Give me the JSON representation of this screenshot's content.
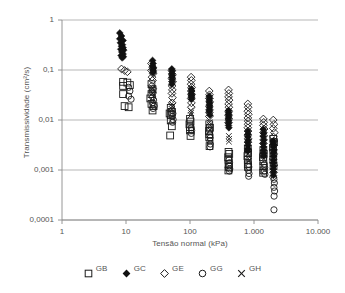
{
  "chart_data": {
    "type": "scatter",
    "title": "",
    "xlabel": "Tensão normal (kPa)",
    "ylabel": "Transmissividade (cm²/s)",
    "xscale": "log",
    "yscale": "log",
    "xlim": [
      1,
      10000
    ],
    "ylim": [
      0.0001,
      1
    ],
    "grid": "horizontal",
    "legend_position": "bottom",
    "xticks": [
      1,
      10,
      100,
      1000,
      10000
    ],
    "xticklabels": [
      "1",
      "10",
      "100",
      "1.000",
      "10.000"
    ],
    "yticks": [
      0.0001,
      0.001,
      0.01,
      0.1,
      1
    ],
    "yticklabels": [
      "0,0001",
      "0,001",
      "0,01",
      "0,1",
      "1"
    ],
    "series": [
      {
        "name": "GB",
        "marker": "open-square",
        "points": [
          [
            9,
            0.058
          ],
          [
            10.5,
            0.056
          ],
          [
            9,
            0.048
          ],
          [
            11.5,
            0.05
          ],
          [
            9,
            0.033
          ],
          [
            9.5,
            0.019
          ],
          [
            11,
            0.018
          ],
          [
            25,
            0.052
          ],
          [
            26,
            0.041
          ],
          [
            25,
            0.033
          ],
          [
            24,
            0.027
          ],
          [
            25,
            0.021
          ],
          [
            27,
            0.019
          ],
          [
            26,
            0.0155
          ],
          [
            50,
            0.0175
          ],
          [
            52,
            0.0145
          ],
          [
            48,
            0.0135
          ],
          [
            50,
            0.0125
          ],
          [
            50,
            0.0098
          ],
          [
            52,
            0.0075
          ],
          [
            49,
            0.0049
          ],
          [
            100,
            0.0105
          ],
          [
            102,
            0.0093
          ],
          [
            98,
            0.0082
          ],
          [
            100,
            0.0072
          ],
          [
            100,
            0.0062
          ],
          [
            102,
            0.0048
          ],
          [
            200,
            0.0082
          ],
          [
            205,
            0.007
          ],
          [
            198,
            0.006
          ],
          [
            200,
            0.0052
          ],
          [
            200,
            0.0045
          ],
          [
            202,
            0.003
          ],
          [
            400,
            0.0023
          ],
          [
            410,
            0.0021
          ],
          [
            395,
            0.0018
          ],
          [
            400,
            0.0016
          ],
          [
            400,
            0.0013
          ],
          [
            405,
            0.00115
          ],
          [
            398,
            0.00098
          ],
          [
            800,
            0.0027
          ],
          [
            810,
            0.0022
          ],
          [
            790,
            0.0019
          ],
          [
            800,
            0.0016
          ],
          [
            800,
            0.0013
          ],
          [
            805,
            0.00115
          ],
          [
            1400,
            0.0025
          ],
          [
            1420,
            0.0021
          ],
          [
            1380,
            0.0018
          ],
          [
            1400,
            0.0015
          ],
          [
            1400,
            0.0012
          ],
          [
            1410,
            0.00098
          ],
          [
            1390,
            0.00088
          ],
          [
            2000,
            0.0042
          ],
          [
            2050,
            0.0036
          ],
          [
            1980,
            0.0028
          ],
          [
            2000,
            0.0022
          ],
          [
            2000,
            0.0016
          ],
          [
            2020,
            0.0012
          ]
        ]
      },
      {
        "name": "GC",
        "marker": "filled-diamond",
        "points": [
          [
            8,
            0.55
          ],
          [
            8.5,
            0.48
          ],
          [
            8,
            0.42
          ],
          [
            9,
            0.39
          ],
          [
            8.2,
            0.35
          ],
          [
            8.8,
            0.32
          ],
          [
            8.5,
            0.3
          ],
          [
            9,
            0.28
          ],
          [
            8.3,
            0.26
          ],
          [
            9.2,
            0.25
          ],
          [
            8.6,
            0.23
          ],
          [
            9,
            0.21
          ],
          [
            8.4,
            0.195
          ],
          [
            9.1,
            0.185
          ],
          [
            8.7,
            0.175
          ],
          [
            26,
            0.155
          ],
          [
            26.5,
            0.135
          ],
          [
            26,
            0.12
          ],
          [
            27,
            0.11
          ],
          [
            26.2,
            0.1
          ],
          [
            26.8,
            0.095
          ],
          [
            26.5,
            0.088
          ],
          [
            52,
            0.105
          ],
          [
            52.5,
            0.095
          ],
          [
            52,
            0.085
          ],
          [
            53,
            0.078
          ],
          [
            52.3,
            0.072
          ],
          [
            52.8,
            0.065
          ],
          [
            52.5,
            0.058
          ],
          [
            52,
            0.052
          ],
          [
            105,
            0.042
          ],
          [
            105.5,
            0.038
          ],
          [
            105,
            0.034
          ],
          [
            106,
            0.032
          ],
          [
            105.3,
            0.03
          ],
          [
            105.8,
            0.028
          ],
          [
            105.5,
            0.026
          ],
          [
            200,
            0.03
          ],
          [
            202,
            0.027
          ],
          [
            200,
            0.024
          ],
          [
            203,
            0.022
          ],
          [
            200.5,
            0.02
          ],
          [
            202,
            0.018
          ],
          [
            201,
            0.016
          ],
          [
            200,
            0.0145
          ],
          [
            205,
            0.0125
          ],
          [
            400,
            0.0155
          ],
          [
            402,
            0.0142
          ],
          [
            400,
            0.013
          ],
          [
            403,
            0.012
          ],
          [
            400.5,
            0.011
          ],
          [
            402,
            0.0098
          ],
          [
            401,
            0.0088
          ],
          [
            400,
            0.0078
          ],
          [
            405,
            0.007
          ],
          [
            800,
            0.006
          ],
          [
            805,
            0.0052
          ],
          [
            800,
            0.0046
          ],
          [
            810,
            0.004
          ],
          [
            800.5,
            0.0036
          ],
          [
            805,
            0.0031
          ],
          [
            802,
            0.0027
          ],
          [
            800,
            0.0024
          ],
          [
            1400,
            0.0065
          ],
          [
            1410,
            0.0055
          ],
          [
            1400,
            0.0047
          ],
          [
            1420,
            0.004
          ],
          [
            1400.5,
            0.0034
          ],
          [
            1410,
            0.0029
          ],
          [
            1405,
            0.0025
          ],
          [
            1400,
            0.0022
          ],
          [
            1415,
            0.0019
          ],
          [
            2000,
            0.0038
          ],
          [
            2020,
            0.0033
          ],
          [
            2000,
            0.0029
          ],
          [
            2040,
            0.0025
          ],
          [
            2005,
            0.0022
          ],
          [
            2020,
            0.0019
          ],
          [
            2010,
            0.0016
          ],
          [
            2000,
            0.0014
          ],
          [
            2030,
            0.0012
          ],
          [
            2000,
            0.00105
          ],
          [
            2020,
            0.0009
          ],
          [
            2010,
            0.00078
          ]
        ]
      },
      {
        "name": "GE",
        "marker": "open-diamond",
        "points": [
          [
            8.5,
            0.105
          ],
          [
            9.5,
            0.098
          ],
          [
            10.5,
            0.092
          ],
          [
            25,
            0.135
          ],
          [
            26,
            0.115
          ],
          [
            25,
            0.098
          ],
          [
            26.5,
            0.085
          ],
          [
            25.5,
            0.072
          ],
          [
            26,
            0.062
          ],
          [
            25.2,
            0.048
          ],
          [
            26.2,
            0.042
          ],
          [
            25.8,
            0.036
          ],
          [
            52,
            0.098
          ],
          [
            53,
            0.082
          ],
          [
            52,
            0.068
          ],
          [
            53.5,
            0.058
          ],
          [
            52.5,
            0.048
          ],
          [
            53,
            0.04
          ],
          [
            52.2,
            0.034
          ],
          [
            53.2,
            0.028
          ],
          [
            52.8,
            0.022
          ],
          [
            104,
            0.072
          ],
          [
            105,
            0.062
          ],
          [
            104,
            0.052
          ],
          [
            106,
            0.045
          ],
          [
            104.5,
            0.038
          ],
          [
            105.5,
            0.032
          ],
          [
            104.2,
            0.027
          ],
          [
            105.2,
            0.022
          ],
          [
            104.8,
            0.018
          ],
          [
            200,
            0.038
          ],
          [
            202,
            0.032
          ],
          [
            200,
            0.027
          ],
          [
            203,
            0.023
          ],
          [
            200.5,
            0.019
          ],
          [
            202,
            0.016
          ],
          [
            201,
            0.014
          ],
          [
            200,
            0.0118
          ],
          [
            400,
            0.04
          ],
          [
            405,
            0.034
          ],
          [
            400,
            0.029
          ],
          [
            408,
            0.025
          ],
          [
            401,
            0.021
          ],
          [
            405,
            0.018
          ],
          [
            402,
            0.015
          ],
          [
            400,
            0.0125
          ],
          [
            404,
            0.0105
          ],
          [
            400,
            0.0088
          ],
          [
            800,
            0.021
          ],
          [
            810,
            0.018
          ],
          [
            800,
            0.015
          ],
          [
            815,
            0.013
          ],
          [
            802,
            0.011
          ],
          [
            810,
            0.0095
          ],
          [
            805,
            0.0082
          ],
          [
            800,
            0.007
          ],
          [
            808,
            0.006
          ],
          [
            800,
            0.005
          ],
          [
            810,
            0.0042
          ],
          [
            805,
            0.0036
          ],
          [
            1400,
            0.0105
          ],
          [
            1420,
            0.009
          ],
          [
            1400,
            0.0078
          ],
          [
            1440,
            0.0066
          ],
          [
            1405,
            0.0056
          ],
          [
            1420,
            0.0048
          ],
          [
            1410,
            0.004
          ],
          [
            1400,
            0.0034
          ],
          [
            2000,
            0.01
          ],
          [
            2050,
            0.0082
          ],
          [
            2000,
            0.0068
          ],
          [
            2080,
            0.0056
          ],
          [
            2010,
            0.0046
          ],
          [
            2050,
            0.0038
          ],
          [
            2020,
            0.0031
          ],
          [
            2000,
            0.0026
          ],
          [
            2040,
            0.0021
          ],
          [
            2000,
            0.00165
          ],
          [
            2050,
            0.00125
          ],
          [
            2020,
            0.0009
          ],
          [
            2000,
            0.00072
          ]
        ]
      },
      {
        "name": "GG",
        "marker": "open-circle",
        "points": [
          [
            11,
            0.045
          ],
          [
            11.5,
            0.038
          ],
          [
            11,
            0.03
          ],
          [
            12,
            0.026
          ],
          [
            26,
            0.029
          ],
          [
            27,
            0.025
          ],
          [
            26,
            0.022
          ],
          [
            27.5,
            0.019
          ],
          [
            26.5,
            0.017
          ],
          [
            53,
            0.0155
          ],
          [
            54,
            0.0135
          ],
          [
            53,
            0.0118
          ],
          [
            54.5,
            0.0102
          ],
          [
            53.5,
            0.009
          ],
          [
            105,
            0.007
          ],
          [
            106,
            0.0062
          ],
          [
            105,
            0.0054
          ],
          [
            205,
            0.005
          ],
          [
            207,
            0.0044
          ],
          [
            205,
            0.0038
          ],
          [
            208,
            0.0033
          ],
          [
            205.5,
            0.0029
          ],
          [
            410,
            0.0016
          ],
          [
            415,
            0.0014
          ],
          [
            410,
            0.0012
          ],
          [
            418,
            0.00105
          ],
          [
            412,
            0.00095
          ],
          [
            820,
            0.0013
          ],
          [
            830,
            0.00115
          ],
          [
            820,
            0.00098
          ],
          [
            835,
            0.00085
          ],
          [
            825,
            0.00075
          ],
          [
            1450,
            0.0013
          ],
          [
            1470,
            0.00112
          ],
          [
            1450,
            0.00095
          ],
          [
            1480,
            0.00082
          ],
          [
            2050,
            0.00065
          ],
          [
            2080,
            0.00055
          ],
          [
            2050,
            0.00045
          ],
          [
            2100,
            0.00038
          ],
          [
            2060,
            0.0003
          ],
          [
            2050,
            0.00016
          ]
        ]
      },
      {
        "name": "GH",
        "marker": "cross",
        "points": [
          [
            26,
            0.044
          ],
          [
            26.5,
            0.039
          ],
          [
            26,
            0.034
          ],
          [
            27,
            0.03
          ],
          [
            52,
            0.021
          ],
          [
            53,
            0.019
          ],
          [
            52,
            0.0165
          ],
          [
            103,
            0.0155
          ],
          [
            104,
            0.0138
          ],
          [
            103,
            0.0125
          ],
          [
            202,
            0.009
          ],
          [
            204,
            0.008
          ],
          [
            202,
            0.0072
          ],
          [
            205,
            0.0063
          ],
          [
            405,
            0.0048
          ],
          [
            408,
            0.0042
          ],
          [
            405,
            0.0037
          ],
          [
            810,
            0.0021
          ],
          [
            820,
            0.0019
          ],
          [
            810,
            0.0017
          ],
          [
            825,
            0.0015
          ],
          [
            1420,
            0.0022
          ],
          [
            1440,
            0.0019
          ],
          [
            1420,
            0.0017
          ],
          [
            2020,
            0.002
          ],
          [
            2040,
            0.0017
          ]
        ]
      }
    ]
  },
  "legend": {
    "items": [
      {
        "label": "GB",
        "marker": "open-square"
      },
      {
        "label": "GC",
        "marker": "filled-diamond"
      },
      {
        "label": "GE",
        "marker": "open-diamond"
      },
      {
        "label": "GG",
        "marker": "open-circle"
      },
      {
        "label": "GH",
        "marker": "cross"
      }
    ]
  },
  "colors": {
    "axis": "#8a8a8a",
    "grid": "#9a9a9a",
    "marker_stroke": "#1a1a1a",
    "marker_fill": "#111111",
    "text": "#555555",
    "background": "#ffffff"
  }
}
